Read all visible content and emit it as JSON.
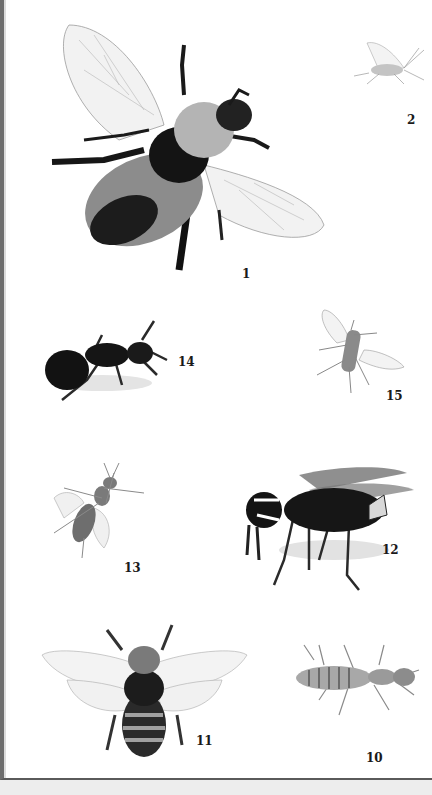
{
  "plate": {
    "background": "#ffffff",
    "border_color": "#5a5a5a",
    "below_band_color": "#ededed",
    "figures": [
      {
        "number": "1",
        "subject": "bumblebee",
        "description": "bumblebee, dorsal view with wings spread"
      },
      {
        "number": "2",
        "subject": "winged-aphid",
        "description": "small winged insect, side view"
      },
      {
        "number": "14",
        "subject": "ant",
        "description": "black ant, side view"
      },
      {
        "number": "15",
        "subject": "fly",
        "description": "small fly, dorsal view with wings spread"
      },
      {
        "number": "13",
        "subject": "small-wasp",
        "description": "small wasp, dorsal view"
      },
      {
        "number": "12",
        "subject": "hornet",
        "description": "black and white hornet, side view"
      },
      {
        "number": "11",
        "subject": "honeybee",
        "description": "honeybee, dorsal view with wings spread"
      },
      {
        "number": "10",
        "subject": "termite",
        "description": "termite, dorsal view"
      }
    ]
  }
}
